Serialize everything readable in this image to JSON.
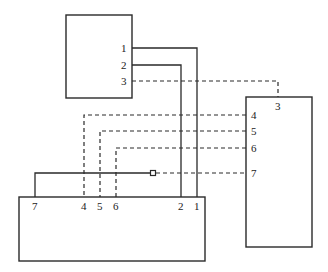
{
  "diagram": {
    "type": "wiring-diagram",
    "boxes": {
      "top": {
        "name": "top-unit"
      },
      "right": {
        "name": "right-unit",
        "pin_labels": [
          "3",
          "4",
          "5",
          "6",
          "7"
        ]
      },
      "bottom": {
        "name": "bottom-unit",
        "pin_labels": [
          "7",
          "4",
          "5",
          "6",
          "2",
          "1"
        ]
      }
    },
    "top_pin_labels": [
      "1",
      "2",
      "3"
    ],
    "right_pin_labels": {
      "p3": "3",
      "p4": "4",
      "p5": "5",
      "p6": "6",
      "p7": "7"
    },
    "bottom_pin_labels": {
      "p7": "7",
      "p4": "4",
      "p5": "5",
      "p6": "6",
      "p2": "2",
      "p1": "1"
    },
    "top_labels": {
      "p1": "1",
      "p2": "2",
      "p3": "3"
    },
    "connections": [
      {
        "from": "top.1",
        "to": "bottom.1",
        "style": "solid"
      },
      {
        "from": "top.2",
        "to": "bottom.2",
        "style": "solid"
      },
      {
        "from": "top.3",
        "to": "right.3",
        "style": "dashed"
      },
      {
        "from": "right.4",
        "to": "bottom.4",
        "style": "dashed"
      },
      {
        "from": "right.5",
        "to": "bottom.5",
        "style": "dashed"
      },
      {
        "from": "right.6",
        "to": "bottom.6",
        "style": "dashed"
      },
      {
        "from": "right.7",
        "to": "bottom.7",
        "style": "solid+dashed",
        "connector": "square"
      }
    ],
    "colors": {
      "line": "#2a2a2a",
      "background": "#ffffff"
    }
  }
}
